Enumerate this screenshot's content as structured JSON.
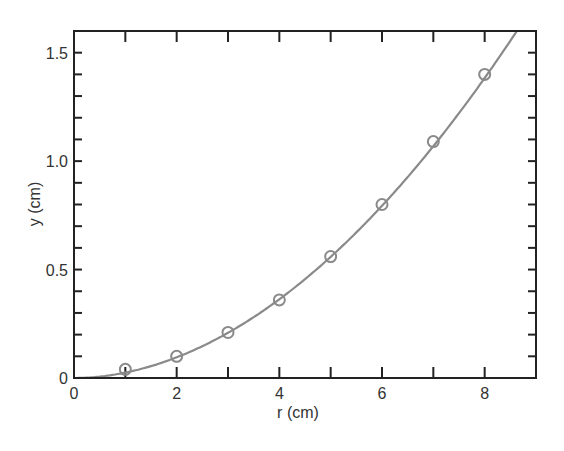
{
  "chart_data": {
    "type": "scatter",
    "title": "",
    "xlabel": "r (cm)",
    "ylabel": "y (cm)",
    "xlim": [
      0,
      9
    ],
    "ylim": [
      0,
      1.6
    ],
    "x_ticks": [
      0,
      2,
      4,
      6,
      8
    ],
    "x_tick_labels": [
      "0",
      "2",
      "4",
      "6",
      "8"
    ],
    "y_ticks": [
      0,
      0.5,
      1.0,
      1.5
    ],
    "y_tick_labels": [
      "0",
      "0.5",
      "1.0",
      "1.5"
    ],
    "grid": false,
    "legend": null,
    "series": [
      {
        "name": "measured",
        "kind": "scatter",
        "marker": "open-circle",
        "color": "#8a8a8a",
        "x": [
          1,
          2,
          3,
          4,
          5,
          6,
          7,
          8
        ],
        "y": [
          0.04,
          0.1,
          0.21,
          0.36,
          0.56,
          0.8,
          1.09,
          1.4
        ]
      },
      {
        "name": "fit",
        "kind": "line",
        "color": "#8a8a8a",
        "formula": "y = 0.025 * r^1.93",
        "x": [
          0,
          1,
          2,
          3,
          4,
          5,
          6,
          7,
          8,
          8.6
        ],
        "y": [
          0,
          0.025,
          0.095,
          0.208,
          0.363,
          0.558,
          0.794,
          1.07,
          1.38,
          1.59
        ]
      }
    ]
  }
}
